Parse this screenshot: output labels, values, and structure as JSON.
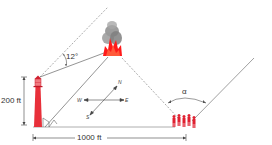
{
  "diagram": {
    "type": "trigonometry-word-problem-figure",
    "labels": {
      "height": "200 ft",
      "distance": "1000 ft",
      "angle_lighthouse": "12°",
      "angle_group": "α"
    },
    "compass": {
      "n": "N",
      "s": "S",
      "e": "E",
      "w": "W"
    },
    "elements": [
      "lighthouse",
      "fire-smoke",
      "group-of-people",
      "compass-rose"
    ],
    "colors": {
      "lighthouse": "#e8303a",
      "fire": "#ff1a1a",
      "smoke": "#8c8c8c",
      "people": "#e02030",
      "lines": "#555555"
    }
  }
}
